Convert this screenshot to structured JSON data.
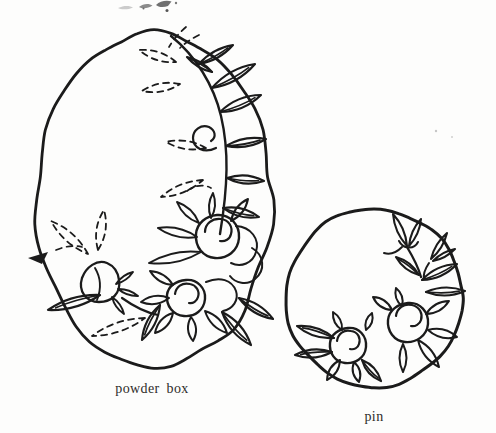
{
  "page": {
    "paper_color": "#fdfdfc",
    "ink_color": "#1b1b1b",
    "caption_color": "#2e2c2a"
  },
  "figures": {
    "powder_box": {
      "caption": "powder box",
      "shape": "scalloped oval",
      "motif": "two roses with spiral centers, pointed petals, leaf vine (solid and dashed leaves), rosebud at left"
    },
    "pin": {
      "caption": "pin",
      "shape": "circle",
      "motif": "two roses with spiral centers, leaves at left, rosebuds with stem at upper right"
    }
  }
}
